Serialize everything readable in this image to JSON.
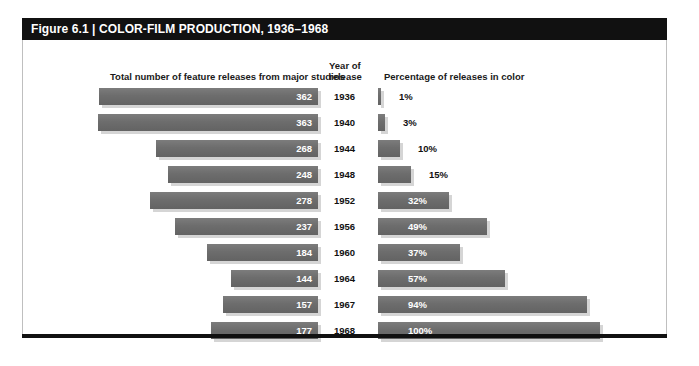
{
  "figure": {
    "title": "Figure 6.1 | COLOR-FILM PRODUCTION, 1936–1968",
    "headers": {
      "left": "Total number of feature releases from major studios",
      "year_line1": "Year of",
      "year_line2": "release",
      "right": "Percentage of releases in color"
    }
  },
  "colors": {
    "title_bar": "#111111",
    "bar_fill": "#6d6d6d",
    "bar_shadow": "#d5d5d5",
    "frame_border": "#bfbfbf",
    "text": "#111111",
    "bar_label_inside": "#ffffff"
  },
  "chart_data": {
    "type": "bar",
    "title": "Figure 6.1 | COLOR-FILM PRODUCTION, 1936–1968",
    "orientation": "horizontal",
    "categories": [
      "1936",
      "1940",
      "1944",
      "1948",
      "1952",
      "1956",
      "1960",
      "1964",
      "1967",
      "1968"
    ],
    "xlabel": "",
    "ylabel": "Year of release",
    "grid": false,
    "legend": "none",
    "series": [
      {
        "name": "Total number of feature releases from major studios",
        "align": "right",
        "unit": "releases",
        "axis_max": 380,
        "values": [
          362,
          363,
          268,
          248,
          278,
          237,
          184,
          144,
          157,
          177
        ],
        "labels": [
          "362",
          "363",
          "268",
          "248",
          "278",
          "237",
          "184",
          "144",
          "157",
          "177"
        ]
      },
      {
        "name": "Percentage of releases in color",
        "align": "left",
        "unit": "%",
        "axis_max": 100,
        "values": [
          1,
          3,
          10,
          15,
          32,
          49,
          37,
          57,
          94,
          100
        ],
        "labels": [
          "1%",
          "3%",
          "10%",
          "15%",
          "32%",
          "49%",
          "37%",
          "57%",
          "94%",
          "100%"
        ],
        "label_inside": [
          false,
          false,
          false,
          false,
          true,
          true,
          true,
          true,
          true,
          true
        ]
      }
    ]
  }
}
